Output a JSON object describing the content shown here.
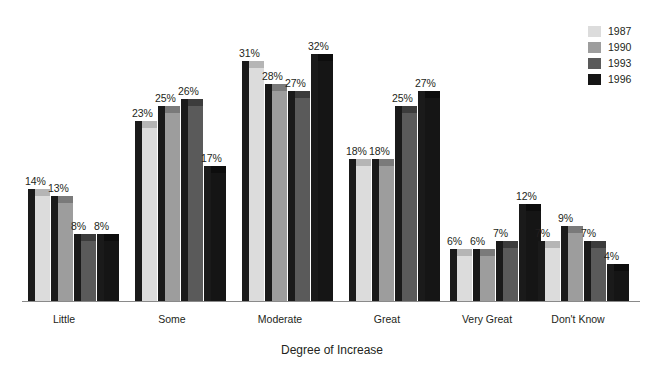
{
  "chart_data": {
    "type": "bar",
    "title": "",
    "subtitle": "",
    "xlabel": "Degree of Increase",
    "ylabel": "",
    "ylim": [
      0,
      35
    ],
    "grid": false,
    "legend_position": "top-right",
    "value_label_suffix": "%",
    "categories": [
      "Little",
      "Some",
      "Moderate",
      "Great",
      "Very Great",
      "Don't Know"
    ],
    "series": [
      {
        "name": "1987",
        "color": "#dcdcdc",
        "values": [
          14,
          23,
          31,
          18,
          6,
          7
        ]
      },
      {
        "name": "1990",
        "color": "#9d9d9d",
        "values": [
          13,
          25,
          28,
          18,
          6,
          9
        ]
      },
      {
        "name": "1993",
        "color": "#5a5a5a",
        "values": [
          8,
          26,
          27,
          25,
          7,
          7
        ]
      },
      {
        "name": "1996",
        "color": "#151515",
        "values": [
          8,
          17,
          32,
          27,
          12,
          4
        ]
      }
    ],
    "value_labels": [
      [
        "14%",
        "13%",
        "8%",
        "8%"
      ],
      [
        "23%",
        "25%",
        "26%",
        "17%"
      ],
      [
        "31%",
        "28%",
        "27%",
        "32%"
      ],
      [
        "18%",
        "18%",
        "25%",
        "27%"
      ],
      [
        "6%",
        "6%",
        "7%",
        "12%"
      ],
      [
        "7%",
        "9%",
        "7%",
        "4%"
      ]
    ]
  },
  "legend": {
    "entries": [
      {
        "label": "1987",
        "color": "#dcdcdc"
      },
      {
        "label": "1990",
        "color": "#9d9d9d"
      },
      {
        "label": "1993",
        "color": "#5a5a5a"
      },
      {
        "label": "1996",
        "color": "#151515"
      }
    ]
  },
  "axis": {
    "x_title": "Degree of Increase"
  }
}
